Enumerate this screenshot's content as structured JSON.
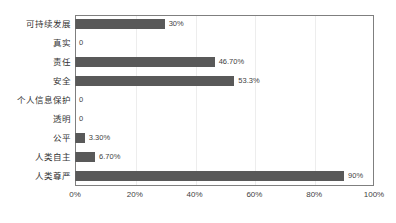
{
  "chart_data": {
    "type": "bar",
    "orientation": "horizontal",
    "title": "",
    "xlabel": "",
    "ylabel": "",
    "xlim": [
      0,
      100
    ],
    "grid": true,
    "legend": false,
    "bar_color": "#595959",
    "categories": [
      "可持续发展",
      "真实",
      "责任",
      "安全",
      "个人信息保护",
      "透明",
      "公平",
      "人类自主",
      "人类尊严"
    ],
    "values": [
      30,
      0,
      46.7,
      53.3,
      0,
      0,
      3.3,
      6.7,
      90
    ],
    "data_labels": [
      "30%",
      "0",
      "46.70%",
      "53.3%",
      "0",
      "0",
      "3.30%",
      "6.70%",
      "90%"
    ],
    "xticks": [
      0,
      20,
      40,
      60,
      80,
      100
    ],
    "xtick_labels": [
      "0%",
      "20%",
      "40%",
      "60%",
      "80%",
      "100%"
    ]
  }
}
